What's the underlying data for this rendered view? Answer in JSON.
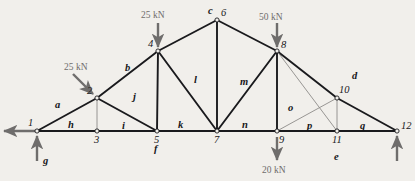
{
  "diagram": {
    "background_color": "#f1efeb",
    "member_color": "#1a1a1d",
    "thin_member_color": "#8d8b89",
    "load_color": "#6f6d6c",
    "node_fill": "#f1efeb"
  },
  "nodes": [
    {
      "id": "1",
      "label": "1",
      "x": 37,
      "y": 131,
      "label_dx": -9,
      "label_dy": -13
    },
    {
      "id": "2",
      "label": "2",
      "x": 97,
      "y": 98,
      "label_dx": -10,
      "label_dy": -12
    },
    {
      "id": "3",
      "label": "3",
      "x": 97,
      "y": 131,
      "label_dx": -3,
      "label_dy": 4
    },
    {
      "id": "4",
      "label": "4",
      "x": 158,
      "y": 51,
      "label_dx": -10,
      "label_dy": -12
    },
    {
      "id": "5",
      "label": "5",
      "x": 157,
      "y": 131,
      "label_dx": -3,
      "label_dy": 4
    },
    {
      "id": "6",
      "label": "6",
      "x": 217,
      "y": 20,
      "label_dx": 4,
      "label_dy": -12
    },
    {
      "id": "7",
      "label": "7",
      "x": 217,
      "y": 131,
      "label_dx": -3,
      "label_dy": 4
    },
    {
      "id": "8",
      "label": "8",
      "x": 277,
      "y": 51,
      "label_dx": 4,
      "label_dy": -11
    },
    {
      "id": "9",
      "label": "9",
      "x": 277,
      "y": 131,
      "label_dx": 2,
      "label_dy": 4
    },
    {
      "id": "10",
      "label": "10",
      "x": 337,
      "y": 98,
      "label_dx": 2,
      "label_dy": -13
    },
    {
      "id": "11",
      "label": "11",
      "x": 337,
      "y": 131,
      "label_dx": -5,
      "label_dy": 4
    },
    {
      "id": "12",
      "label": "12",
      "x": 397,
      "y": 131,
      "label_dx": 4,
      "label_dy": -10
    }
  ],
  "members": [
    {
      "from": "1",
      "to": "3",
      "weight": "thick"
    },
    {
      "from": "3",
      "to": "5",
      "weight": "thick"
    },
    {
      "from": "5",
      "to": "7",
      "weight": "thick"
    },
    {
      "from": "7",
      "to": "9",
      "weight": "thick"
    },
    {
      "from": "9",
      "to": "11",
      "weight": "thick"
    },
    {
      "from": "11",
      "to": "12",
      "weight": "thick"
    },
    {
      "from": "1",
      "to": "2",
      "weight": "thick"
    },
    {
      "from": "2",
      "to": "4",
      "weight": "thick"
    },
    {
      "from": "4",
      "to": "6",
      "weight": "thick"
    },
    {
      "from": "6",
      "to": "8",
      "weight": "thick"
    },
    {
      "from": "8",
      "to": "10",
      "weight": "thick"
    },
    {
      "from": "10",
      "to": "12",
      "weight": "thick"
    },
    {
      "from": "2",
      "to": "3",
      "weight": "thin"
    },
    {
      "from": "2",
      "to": "5",
      "weight": "thick"
    },
    {
      "from": "4",
      "to": "5",
      "weight": "thick"
    },
    {
      "from": "4",
      "to": "7",
      "weight": "thick"
    },
    {
      "from": "6",
      "to": "7",
      "weight": "thick"
    },
    {
      "from": "8",
      "to": "7",
      "weight": "thick"
    },
    {
      "from": "8",
      "to": "9",
      "weight": "thick"
    },
    {
      "from": "8",
      "to": "11",
      "weight": "thin"
    },
    {
      "from": "10",
      "to": "9",
      "weight": "thin"
    },
    {
      "from": "10",
      "to": "11",
      "weight": "thin"
    }
  ],
  "region_labels": [
    {
      "text": "a",
      "x": 55,
      "y": 100
    },
    {
      "text": "b",
      "x": 125,
      "y": 63
    },
    {
      "text": "c",
      "x": 208,
      "y": 6
    },
    {
      "text": "d",
      "x": 352,
      "y": 71
    },
    {
      "text": "e",
      "x": 334,
      "y": 152
    },
    {
      "text": "f",
      "x": 154,
      "y": 144
    },
    {
      "text": "g",
      "x": 43,
      "y": 156
    },
    {
      "text": "h",
      "x": 68,
      "y": 120
    },
    {
      "text": "i",
      "x": 122,
      "y": 121
    },
    {
      "text": "j",
      "x": 133,
      "y": 92
    },
    {
      "text": "k",
      "x": 178,
      "y": 120
    },
    {
      "text": "l",
      "x": 194,
      "y": 75
    },
    {
      "text": "m",
      "x": 240,
      "y": 77
    },
    {
      "text": "n",
      "x": 242,
      "y": 120
    },
    {
      "text": "o",
      "x": 288,
      "y": 103
    },
    {
      "text": "p",
      "x": 307,
      "y": 121
    },
    {
      "text": "q",
      "x": 360,
      "y": 121
    }
  ],
  "loads": [
    {
      "id": "load-25kn-node2",
      "text": "25 kN",
      "value": 25,
      "unit": "kN",
      "applied_at": "2",
      "direction": "diagonal-down-right",
      "label_x": 64,
      "label_y": 63
    },
    {
      "id": "load-25kn-node4",
      "text": "25 kN",
      "value": 25,
      "unit": "kN",
      "applied_at": "4",
      "direction": "down",
      "label_x": 141,
      "label_y": 11
    },
    {
      "id": "load-50kn-node8",
      "text": "50 kN",
      "value": 50,
      "unit": "kN",
      "applied_at": "8",
      "direction": "down",
      "label_x": 259,
      "label_y": 13
    },
    {
      "id": "load-20kn-node9",
      "text": "20 kN",
      "value": 20,
      "unit": "kN",
      "applied_at": "9",
      "direction": "down",
      "label_x": 262,
      "label_y": 166
    }
  ],
  "reactions": [
    {
      "id": "reaction-horizontal-node1",
      "applied_at": "1",
      "direction": "left"
    },
    {
      "id": "reaction-vertical-node1",
      "applied_at": "1",
      "direction": "up"
    },
    {
      "id": "reaction-vertical-node12",
      "applied_at": "12",
      "direction": "up"
    }
  ]
}
